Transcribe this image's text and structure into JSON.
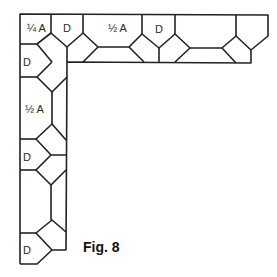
{
  "figure": {
    "caption": "Fig. 8",
    "stroke_color": "#222222",
    "background": "#ffffff"
  },
  "labels": {
    "top_quarter_a": "¼ A",
    "top_d1": "D",
    "top_half_a": "½ A",
    "top_d2": "D",
    "left_d1": "D",
    "left_half_a": "½ A",
    "left_d2": "D",
    "left_d3": "D"
  }
}
